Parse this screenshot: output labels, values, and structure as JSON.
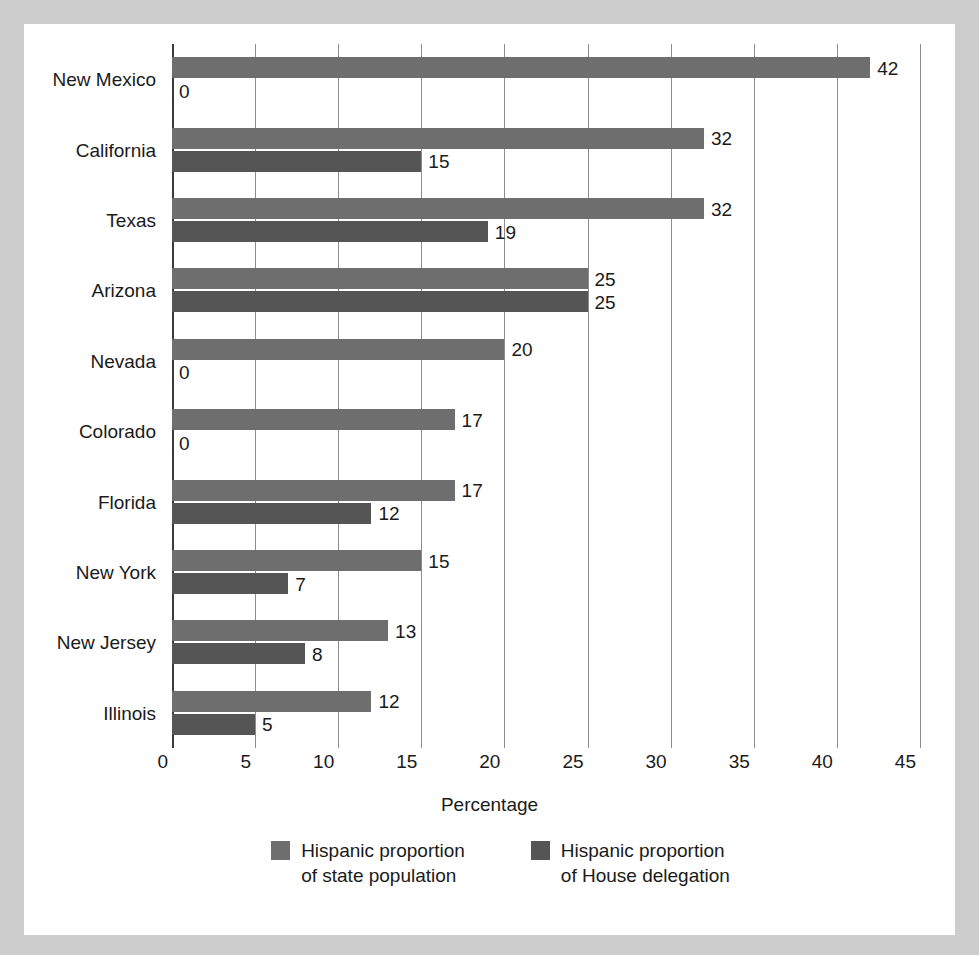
{
  "chart_data": {
    "type": "bar",
    "orientation": "horizontal",
    "title": "",
    "xlabel": "Percentage",
    "ylabel": "",
    "xlim": [
      0,
      45
    ],
    "xticks": [
      0,
      5,
      10,
      15,
      20,
      25,
      30,
      35,
      40,
      45
    ],
    "grid": "vertical",
    "legend_position": "bottom",
    "categories": [
      "New Mexico",
      "California",
      "Texas",
      "Arizona",
      "Nevada",
      "Colorado",
      "Florida",
      "New York",
      "New Jersey",
      "Illinois"
    ],
    "series": [
      {
        "name": "Hispanic proportion\nof state population",
        "color": "#6e6e6e",
        "values": [
          42,
          32,
          32,
          25,
          20,
          17,
          17,
          15,
          13,
          12
        ]
      },
      {
        "name": "Hispanic proportion\nof House delegation",
        "color": "#555555",
        "values": [
          0,
          15,
          19,
          25,
          0,
          0,
          12,
          7,
          8,
          5
        ]
      }
    ],
    "value_labels": [
      [
        "42",
        "0"
      ],
      [
        "32",
        "15"
      ],
      [
        "32",
        "19"
      ],
      [
        "25",
        "25"
      ],
      [
        "20",
        "0"
      ],
      [
        "17",
        "0"
      ],
      [
        "17",
        "12"
      ],
      [
        "15",
        "7"
      ],
      [
        "13",
        "8"
      ],
      [
        "12",
        "5"
      ]
    ]
  },
  "legend": [
    {
      "label": "Hispanic proportion\nof state population",
      "color": "#6e6e6e"
    },
    {
      "label": "Hispanic proportion\nof House delegation",
      "color": "#555555"
    }
  ],
  "axis": {
    "x_title": "Percentage",
    "tick_labels": [
      "0",
      "5",
      "10",
      "15",
      "20",
      "25",
      "30",
      "35",
      "40",
      "45"
    ]
  },
  "colors": {
    "page_background": "#cdcdcd",
    "card_background": "#ffffff",
    "gridline": "#8d8d8d",
    "axis": "#3a3a3a",
    "text": "#1a1a1a",
    "series_population": "#6e6e6e",
    "series_house": "#555555"
  }
}
